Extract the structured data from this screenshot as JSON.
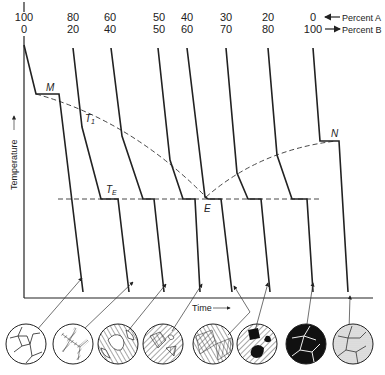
{
  "diagram": {
    "composition_labels": [
      {
        "a": "100",
        "b": "0"
      },
      {
        "a": "80",
        "b": "20"
      },
      {
        "a": "60",
        "b": "40"
      },
      {
        "a": "50",
        "b": "50"
      },
      {
        "a": "40",
        "b": "60"
      },
      {
        "a": "30",
        "b": "70"
      },
      {
        "a": "20",
        "b": "80"
      },
      {
        "a": "0",
        "b": "100"
      }
    ],
    "legend": {
      "percent_a": "Percent A",
      "percent_b": "Percent B",
      "var_a": "A",
      "var_b": "B",
      "arrow": "←"
    },
    "axes": {
      "ylabel": "Temperature",
      "xlabel": "Time"
    },
    "points": {
      "M": "M",
      "N": "N",
      "E": "E",
      "T1": "T",
      "T1_sub": "1",
      "TE": "T",
      "TE_sub": "E"
    },
    "microstructures": [
      {
        "name": "pure-A-grains",
        "fill": "white"
      },
      {
        "name": "primary-A-with-eutectic",
        "fill": "white"
      },
      {
        "name": "primary-A-more-eutectic",
        "fill": "white"
      },
      {
        "name": "near-eutectic",
        "fill": "white"
      },
      {
        "name": "eutectic",
        "fill": "hatched"
      },
      {
        "name": "primary-B-in-eutectic",
        "fill": "hatched"
      },
      {
        "name": "primary-B-dominant",
        "fill": "black"
      },
      {
        "name": "pure-B-grains",
        "fill": "stippled"
      }
    ]
  }
}
